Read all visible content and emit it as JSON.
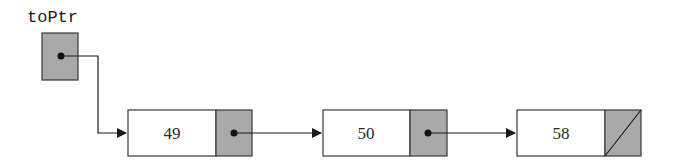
{
  "diagram": {
    "type": "linked-list",
    "head_pointer": {
      "label": "toPtr"
    },
    "nodes": [
      {
        "value": "49",
        "next": "pointer"
      },
      {
        "value": "50",
        "next": "pointer"
      },
      {
        "value": "58",
        "next": "null"
      }
    ]
  },
  "colors": {
    "pointer_fill": "#a9a9a9",
    "box_stroke": "#3a3a3a",
    "line": "#1a1a1a",
    "background": "#ffffff"
  }
}
